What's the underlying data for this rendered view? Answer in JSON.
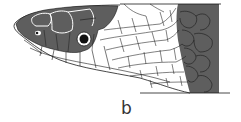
{
  "figure": {
    "panel_label": "b",
    "colors": {
      "dark_scale": "#5e5e5e",
      "outline": "#1a1a1a",
      "light_scale": "#ffffff",
      "label": "#333333"
    }
  }
}
